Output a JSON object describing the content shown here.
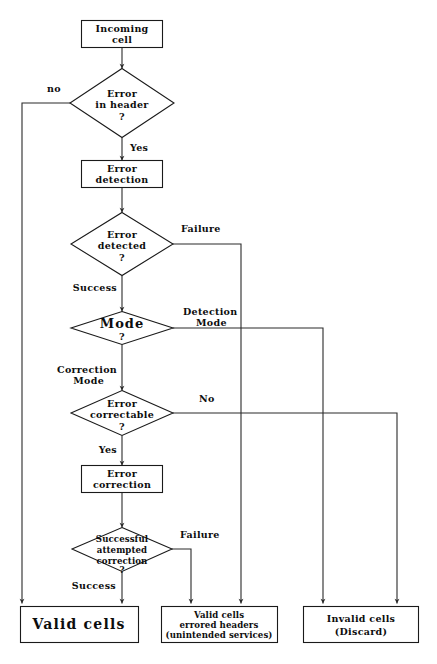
{
  "diagram": {
    "colors": {
      "background": "#ffffff",
      "stroke": "#2b2b2b",
      "text": "#0d0d0d",
      "node_fill": "#ffffff"
    },
    "nodes": {
      "incoming_cell": {
        "shape": "process",
        "line1": "Incoming",
        "line2": "cell"
      },
      "error_in_header": {
        "shape": "decision",
        "line1": "Error",
        "line2": "in  header",
        "line3": "?"
      },
      "error_detection": {
        "shape": "process",
        "line1": "Error",
        "line2": "detection"
      },
      "error_detected": {
        "shape": "decision",
        "line1": "Error",
        "line2": "detected",
        "line3": "?"
      },
      "mode": {
        "shape": "decision",
        "line1": "Mode",
        "line2": "?"
      },
      "error_correctable": {
        "shape": "decision",
        "line1": "Error",
        "line2": "correctable",
        "line3": "?"
      },
      "error_correction": {
        "shape": "process",
        "line1": "Error",
        "line2": "correction"
      },
      "successful_correction": {
        "shape": "decision",
        "line1": "Successful",
        "line2": "attempted",
        "line3": "correction",
        "line4": "?"
      },
      "valid_cells": {
        "shape": "terminal",
        "line1": "Valid  cells"
      },
      "valid_cells_errored": {
        "shape": "terminal",
        "line1": "Valid  cells",
        "line2": "errored  headers",
        "line3": "(unintended  services)"
      },
      "invalid_cells": {
        "shape": "terminal",
        "line1": "Invalid  cells",
        "line2": "(Discard)"
      }
    },
    "edge_labels": {
      "no_header_error": "no",
      "yes_header_error": "Yes",
      "detect_failure": "Failure",
      "detect_success": "Success",
      "detection_mode": "Detection",
      "detection_mode2": "Mode",
      "correction_mode": "Correction",
      "correction_mode2": "Mode",
      "not_correctable": "No",
      "correctable_yes": "Yes",
      "correction_failure": "Failure",
      "correction_success": "Success"
    }
  }
}
